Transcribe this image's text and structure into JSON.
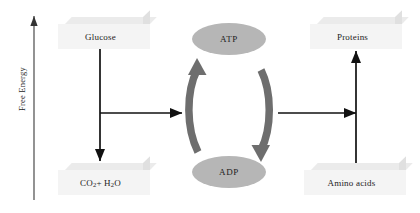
{
  "diagram": {
    "axis": {
      "label": "Free Energy",
      "direction": "upward",
      "arrow_icon": "arrow-up-icon"
    },
    "catabolism": {
      "source_label": "Glucose",
      "product_label_html": "CO<sub>2</sub> + H<sub>2</sub>O",
      "product_label_text": "CO2 + H2O",
      "down_arrow_icon": "arrow-down-icon",
      "branch_arrow_icon": "arrow-right-icon"
    },
    "anabolism": {
      "source_label": "Amino acids",
      "product_label": "Proteins",
      "up_arrow_icon": "arrow-up-icon",
      "branch_arrow_icon": "arrow-right-icon"
    },
    "cycle": {
      "top_label": "ATP",
      "bottom_label": "ADP",
      "left_arc_icon": "curved-arrow-up-icon",
      "right_arc_icon": "curved-arrow-down-icon"
    },
    "colors": {
      "box_front": "#f4f4f4",
      "box_top": "#ebebeb",
      "box_side": "#e0e0e0",
      "ellipse_fill": "#b6b6b6",
      "cycle_arrow": "#6e6e6e",
      "line": "#111111",
      "text": "#1c1c1c",
      "background": "#ffffff"
    }
  }
}
